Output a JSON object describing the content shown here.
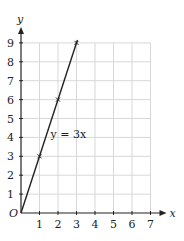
{
  "chart_data": {
    "type": "line",
    "title": "",
    "xlabel": "x",
    "ylabel": "y",
    "origin_label": "O",
    "xlim": [
      0,
      7
    ],
    "ylim": [
      0,
      9
    ],
    "x_ticks": [
      "1",
      "2",
      "3",
      "4",
      "5",
      "6",
      "7"
    ],
    "y_ticks": [
      "1",
      "2",
      "3",
      "4",
      "5",
      "6",
      "7",
      "8",
      "9"
    ],
    "grid": true,
    "series": [
      {
        "name": "y = 3x",
        "x": [
          0,
          1,
          2,
          3
        ],
        "values": [
          0,
          3,
          6,
          9
        ],
        "marked_points": [
          [
            1,
            3
          ],
          [
            2,
            6
          ],
          [
            3,
            9
          ]
        ]
      }
    ],
    "annotations": [
      {
        "text": "y = 3x",
        "x": 1.6,
        "y": 4.2
      }
    ],
    "colors": {
      "grid": "#d8d8d8",
      "axis": "#222222",
      "line": "#222222"
    }
  }
}
